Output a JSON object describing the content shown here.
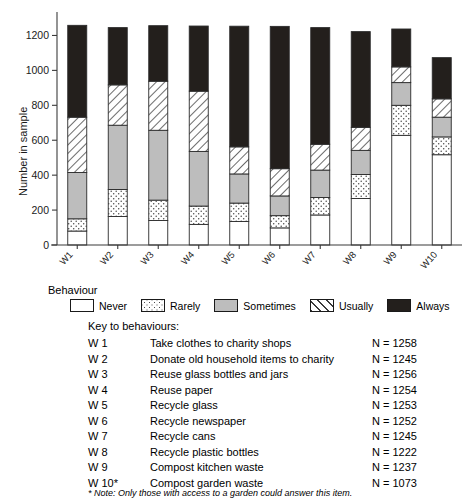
{
  "chart_data": {
    "type": "bar",
    "stacked": true,
    "title": "",
    "xlabel": "",
    "ylabel": "Number in sample",
    "ylim": [
      0,
      1300
    ],
    "yticks": [
      0,
      200,
      400,
      600,
      800,
      1000,
      1200
    ],
    "ytick_labels": [
      "0",
      "200",
      "400",
      "600",
      "800",
      "1000",
      "1200"
    ],
    "grid": false,
    "legend_position": "below-axes",
    "categories": [
      "W1",
      "W2",
      "W3",
      "W4",
      "W5",
      "W6",
      "W7",
      "W8",
      "W9",
      "W10"
    ],
    "series": [
      {
        "name": "Never",
        "fill": "#ffffff",
        "pattern": "solid-white",
        "values": [
          80,
          163,
          140,
          118,
          135,
          98,
          172,
          266,
          628,
          517
        ]
      },
      {
        "name": "Rarely",
        "fill": "#ffffff",
        "pattern": "dotted",
        "values": [
          70,
          155,
          117,
          105,
          105,
          70,
          100,
          138,
          172,
          102
        ]
      },
      {
        "name": "Sometimes",
        "fill": "#bdbdbd",
        "pattern": "solid-grey",
        "values": [
          265,
          368,
          400,
          313,
          167,
          113,
          157,
          138,
          130,
          113
        ]
      },
      {
        "name": "Usually",
        "fill": "#ffffff",
        "pattern": "diagonal-hatch",
        "values": [
          317,
          231,
          281,
          345,
          155,
          156,
          148,
          132,
          90,
          105
        ]
      },
      {
        "name": "Always",
        "fill": "#231f1c",
        "pattern": "solid-black",
        "values": [
          526,
          328,
          318,
          373,
          691,
          815,
          668,
          548,
          217,
          236
        ]
      }
    ],
    "totals": [
      1258,
      1245,
      1256,
      1254,
      1253,
      1252,
      1245,
      1222,
      1237,
      1073
    ]
  },
  "legend": {
    "title": "Behaviour",
    "items": [
      {
        "label": "Never",
        "swatch": "never-swatch"
      },
      {
        "label": "Rarely",
        "swatch": "rarely-swatch"
      },
      {
        "label": "Sometimes",
        "swatch": "sometimes-swatch"
      },
      {
        "label": "Usually",
        "swatch": "usually-swatch"
      },
      {
        "label": "Always",
        "swatch": "always-swatch"
      }
    ]
  },
  "key": {
    "title": "Key to behaviours:",
    "rows": [
      {
        "code": "W 1",
        "description": "Take clothes to charity shops",
        "n": "N = 1258"
      },
      {
        "code": "W 2",
        "description": "Donate old household items to charity",
        "n": "N = 1245"
      },
      {
        "code": "W 3",
        "description": "Reuse glass bottles and jars",
        "n": "N = 1256"
      },
      {
        "code": "W 4",
        "description": "Reuse paper",
        "n": "N = 1254"
      },
      {
        "code": "W 5",
        "description": "Recycle glass",
        "n": "N = 1253"
      },
      {
        "code": "W 6",
        "description": "Recycle newspaper",
        "n": "N = 1252"
      },
      {
        "code": "W 7",
        "description": "Recycle cans",
        "n": "N = 1245"
      },
      {
        "code": "W 8",
        "description": "Recycle plastic bottles",
        "n": "N = 1222"
      },
      {
        "code": "W 9",
        "description": "Compost kitchen waste",
        "n": "N = 1237"
      },
      {
        "code": "W 10*",
        "description": "Compost garden waste",
        "n": "N = 1073"
      }
    ],
    "note": "* Note: Only those with access to a garden could answer this item."
  }
}
